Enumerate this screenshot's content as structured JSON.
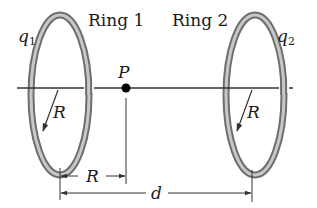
{
  "diagram": {
    "title": "",
    "labels": {
      "ring1": "Ring 1",
      "ring2": "Ring 2",
      "q1_main": "q",
      "q1_sub": "1",
      "q2_main": "q",
      "q2_sub": "2",
      "point": "P",
      "radius_ring1": "R",
      "radius_ring2": "R",
      "dim_R": "R",
      "dim_d": "d"
    },
    "colors": {
      "ring_outer": "#6e6e6e",
      "ring_inner": "#c8c8c8",
      "line": "#333333",
      "point": "#000000",
      "background": "#ffffff"
    },
    "elements": [
      {
        "id": "ring1",
        "type": "ring",
        "label": "Ring 1",
        "charge": "q1",
        "radius": "R"
      },
      {
        "id": "ring2",
        "type": "ring",
        "label": "Ring 2",
        "charge": "q2",
        "radius": "R"
      },
      {
        "id": "axis",
        "type": "line",
        "description": "central axis through both rings"
      },
      {
        "id": "P",
        "type": "point",
        "label": "P",
        "on": "axis"
      },
      {
        "id": "dim-R",
        "type": "dimension",
        "label": "R",
        "from": "ring1 center",
        "to": "P"
      },
      {
        "id": "dim-d",
        "type": "dimension",
        "label": "d",
        "from": "ring1 center",
        "to": "ring2 center"
      }
    ]
  }
}
